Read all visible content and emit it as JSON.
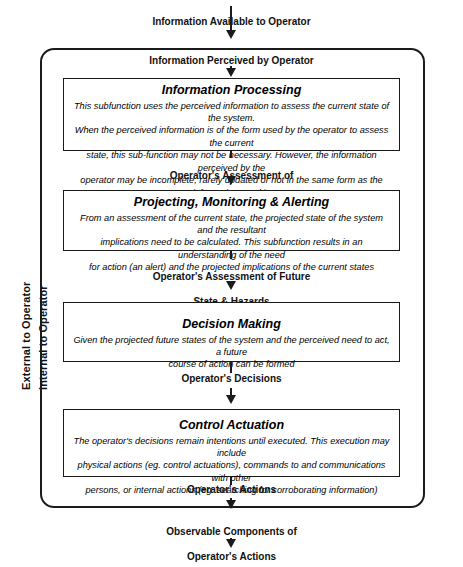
{
  "diagram": {
    "side_labels": {
      "external": "External to Operator",
      "internal": "Internal to Operator"
    },
    "flows": {
      "information_available": "Information Available to Operator",
      "information_perceived": "Information Perceived by Operator",
      "assessment_current_1": "Operator's Assessment of",
      "assessment_current_2": "Current State",
      "assessment_future_1": "Operator's Assessment of Future",
      "assessment_future_2": "State & Hazards",
      "decisions": "Operator's Decisions",
      "actions": "Operator's Actions",
      "observable_1": "Observable Components of",
      "observable_2": "Operator's Actions"
    },
    "boxes": [
      {
        "id": "information-processing",
        "title": "Information Processing",
        "lines": [
          "This subfunction uses the perceived information to assess the current state of the system.",
          "When the perceived information is of the form used by the  operator to assess the current",
          "state, this sub-function may not be necessary.  However, the information perceived by the",
          "operator may be incomplete, rarely updated or not in the same form as the information used in",
          "assessing the state of the system, requiring substantial processing."
        ]
      },
      {
        "id": "projecting-monitoring-alerting",
        "title": "Projecting, Monitoring  & Alerting",
        "lines": [
          "From an assessment of the current state, the projected state of the system and the resultant",
          "implications need to be calculated.  This subfunction results in an understanding of the need",
          "for action (an alert) and the projected implications of the current states"
        ]
      },
      {
        "id": "decision-making",
        "title": "Decision Making",
        "lines": [
          "Given the projected future states of the system and the perceived need to act, a future",
          "course of action can be formed"
        ]
      },
      {
        "id": "control-actuation",
        "title": "Control Actuation",
        "lines": [
          "The operator's decisions remain intentions until executed.  This execution may include",
          "physical actions (eg. control actuations), commands to and communications with other",
          "persons, or internal actions (eg. searching for corroborating information)"
        ]
      }
    ],
    "colors": {
      "line": "#1b1b1b",
      "text": "#000000",
      "background": "#ffffff"
    }
  }
}
